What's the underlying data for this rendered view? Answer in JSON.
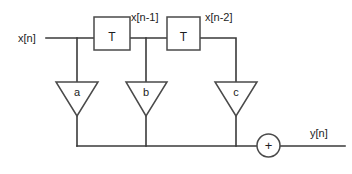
{
  "diagram": {
    "stroke_color": "#3a3a3a",
    "shape_fill": "#ffffff",
    "background": "#ffffff",
    "input": {
      "label": "x[n]"
    },
    "output": {
      "label": "y[n]"
    },
    "delay_blocks": [
      {
        "label": "T",
        "output_signal": "x[n-1]"
      },
      {
        "label": "T",
        "output_signal": "x[n-2]"
      }
    ],
    "gains": [
      {
        "label": "a"
      },
      {
        "label": "b"
      },
      {
        "label": "c"
      }
    ],
    "adder": {
      "label": "+"
    }
  }
}
